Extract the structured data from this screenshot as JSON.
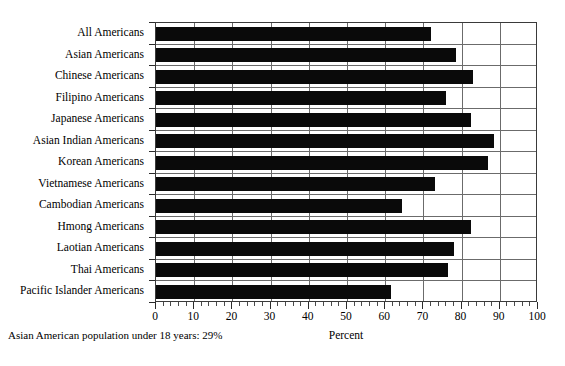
{
  "chart_data": {
    "type": "bar",
    "orientation": "horizontal",
    "title": "",
    "xlabel": "Percent",
    "ylabel": "",
    "xlim": [
      0,
      100
    ],
    "xticks": [
      0,
      10,
      20,
      30,
      40,
      50,
      60,
      70,
      80,
      90,
      100
    ],
    "xtick_labels": [
      "0",
      "10",
      "20",
      "30",
      "40",
      "50",
      "60",
      "70",
      "80",
      "90",
      "100"
    ],
    "minor_tick_step": 2,
    "grid": "vertical-and-row-separators",
    "legend": "none",
    "bar_color": "#0a0a0a",
    "categories": [
      "All Americans",
      "Asian Americans",
      "Chinese Americans",
      "Filipino Americans",
      "Japanese Americans",
      "Asian Indian Americans",
      "Korean Americans",
      "Vietnamese Americans",
      "Cambodian Americans",
      "Hmong Americans",
      "Laotian Americans",
      "Thai Americans",
      "Pacific Islander Americans"
    ],
    "values": [
      72,
      78.5,
      83,
      76,
      82.5,
      88.5,
      87,
      73,
      64.5,
      82.5,
      78,
      76.5,
      61.5
    ],
    "footnote": "Asian American population under 18 years: 29%"
  }
}
